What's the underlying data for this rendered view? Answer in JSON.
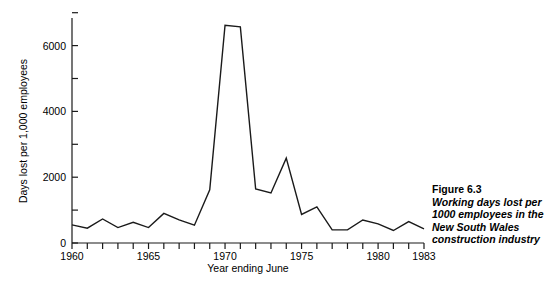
{
  "figure": {
    "caption_number": "Figure 6.3",
    "caption_text": "Working days lost per 1000 employees in the New South Wales construction industry"
  },
  "chart_data": {
    "type": "line",
    "title": "",
    "xlabel": "Year ending June",
    "ylabel": "Days lost per 1,000 employees",
    "xlim": [
      1960,
      1983
    ],
    "ylim": [
      0,
      7000
    ],
    "xticks": [
      1960,
      1965,
      1970,
      1975,
      1980,
      1983
    ],
    "xtick_labels": [
      "1960",
      "1965",
      "1970",
      "1975",
      "1980",
      "1983"
    ],
    "yticks": [
      0,
      2000,
      4000,
      6000
    ],
    "ytick_labels": [
      "0",
      "2000",
      "4000",
      "6000"
    ],
    "yminorticks": [
      1000,
      3000,
      5000,
      7000
    ],
    "grid": false,
    "legend": null,
    "line_color": "#1a1a1a",
    "x": [
      1960,
      1961,
      1962,
      1963,
      1964,
      1965,
      1966,
      1967,
      1968,
      1969,
      1970,
      1971,
      1972,
      1973,
      1974,
      1975,
      1976,
      1977,
      1978,
      1979,
      1980,
      1981,
      1982,
      1983
    ],
    "values": [
      550,
      450,
      730,
      470,
      630,
      470,
      900,
      700,
      540,
      1620,
      6620,
      6570,
      1640,
      1520,
      2580,
      870,
      1100,
      400,
      400,
      700,
      580,
      380,
      650,
      430
    ],
    "series": [
      {
        "name": "Working days lost per 1000 employees",
        "values": [
          550,
          450,
          730,
          470,
          630,
          470,
          900,
          700,
          540,
          1620,
          6620,
          6570,
          1640,
          1520,
          2580,
          870,
          1100,
          400,
          400,
          700,
          580,
          380,
          650,
          430
        ]
      }
    ]
  }
}
